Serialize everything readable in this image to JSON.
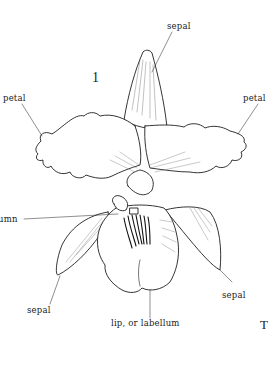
{
  "diagram": {
    "figure_number": "1",
    "labels": {
      "sepal_top": "sepal",
      "petal_left": "petal",
      "petal_right": "petal",
      "column": "umn",
      "sepal_left": "sepal",
      "sepal_right": "sepal",
      "lip": "lip, or labellum"
    },
    "edge_text": "T",
    "colors": {
      "ink": "#222222",
      "background": "#ffffff"
    }
  }
}
